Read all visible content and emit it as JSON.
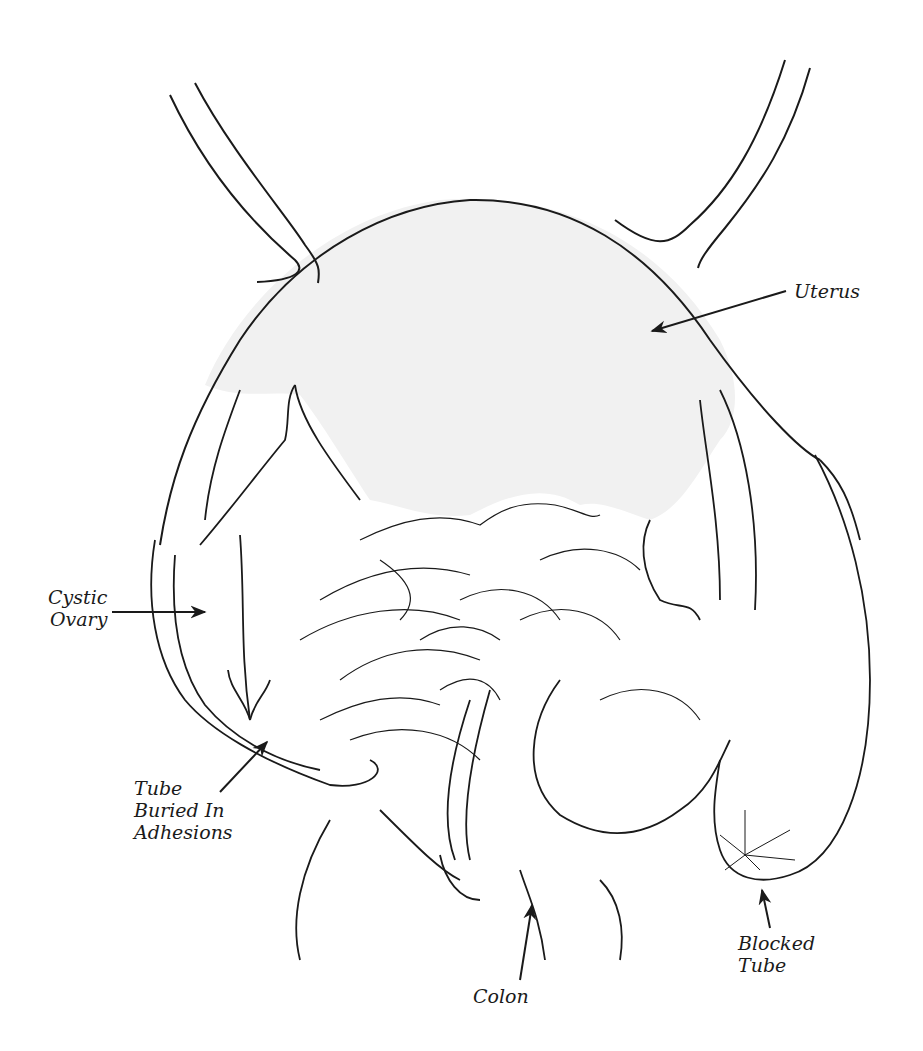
{
  "diagram": {
    "colors": {
      "stroke": "#1a1a1a",
      "uterus_fill": "#f1f1f1",
      "background": "#ffffff"
    },
    "labels": [
      {
        "id": "uterus",
        "lines": [
          "Uterus"
        ]
      },
      {
        "id": "cystic-ovary",
        "lines": [
          "Cystic",
          "Ovary"
        ]
      },
      {
        "id": "tube-buried",
        "lines": [
          "Tube",
          "Buried In",
          "Adhesions"
        ]
      },
      {
        "id": "blocked-tube",
        "lines": [
          "Blocked",
          "Tube"
        ]
      },
      {
        "id": "colon",
        "lines": [
          "Colon"
        ]
      }
    ]
  }
}
